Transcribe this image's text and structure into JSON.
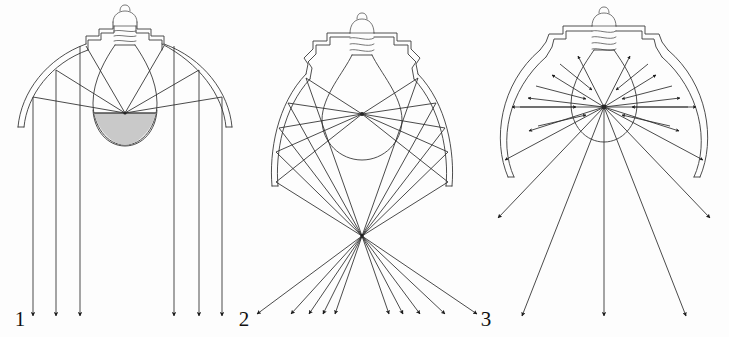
{
  "figure": {
    "background_color": "#fdfdfd",
    "line_color": "#3a3a3a",
    "ray_color": "#2b2b2b",
    "filament_fill_color": "#c9c9c9",
    "label_color": "#111111"
  },
  "labels": [
    {
      "id": "label-1",
      "text": "1",
      "x": 20,
      "y": 326
    },
    {
      "id": "label-2",
      "text": "2",
      "x": 240,
      "y": 326
    },
    {
      "id": "label-3",
      "text": "3",
      "x": 481,
      "y": 326
    }
  ],
  "panels": [
    {
      "id": "panel-parabolic",
      "name": "parabolic-reflector-panel",
      "label_ref": "1",
      "reflector_type": "parabolic",
      "beam_type": "collimated-parallel-down",
      "description": "Parabolic reflector with silvered bulb crown producing parallel downward beam",
      "ray_count": 6,
      "bulb_shaded": true,
      "arrow_x_positions": [
        33,
        56,
        80,
        174,
        199,
        222
      ],
      "arrow_tip_y": 318
    },
    {
      "id": "panel-elliptical",
      "name": "elliptical-reflector-panel",
      "label_ref": "2 to 3",
      "reflector_type": "elliptical",
      "beam_type": "converging-then-diverging",
      "description": "Elliptical reflector focusing rays through an external focal point then spreading",
      "ray_count": 10,
      "bulb_shaded": false,
      "focus_point": {
        "x": 362,
        "y": 236
      },
      "arrow_tip_y": 318
    },
    {
      "id": "panel-diffuse",
      "name": "spherical-reflector-panel",
      "label_ref": "3",
      "reflector_type": "spherical-wide",
      "beam_type": "wide-flood-divergent",
      "description": "Wide spherical reflector with rays radiating from the filament centre in all directions",
      "ray_count": 16,
      "bulb_shaded": false,
      "center_point": {
        "x": 604,
        "y": 107
      },
      "arrow_tip_y": 318
    }
  ],
  "components": {
    "socket_label": "screw-base-socket",
    "bulb_label": "incandescent-bulb-envelope",
    "reflector_label": "reflector-shell",
    "filament_label": "filament-point"
  }
}
